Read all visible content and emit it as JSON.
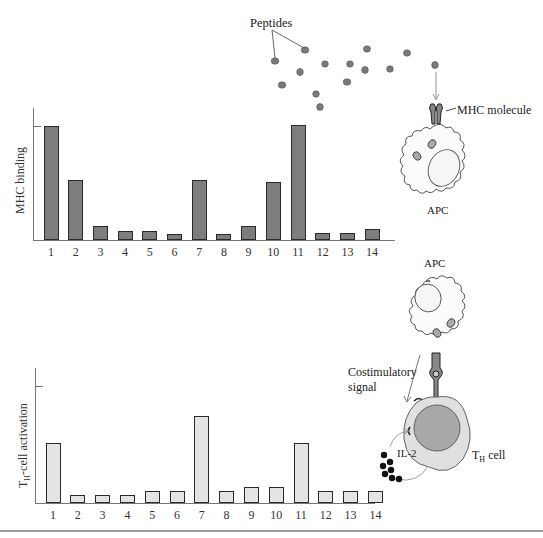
{
  "top_panel": {
    "ylabel": "MHC binding",
    "peptides_label": "Peptides",
    "mhc_label": "MHC molecule",
    "apc_label": "APC"
  },
  "bottom_panel": {
    "ylabel_main": "T",
    "ylabel_sub": "H",
    "ylabel_rest": "-cell activation",
    "apc_label": "APC",
    "costim_label_line1": "Costimulatory",
    "costim_label_line2": "signal",
    "il2_label": "IL-2",
    "th_label_main": "T",
    "th_label_sub": "H",
    "th_label_rest": " cell"
  },
  "chart_data": [
    {
      "type": "bar",
      "title": "",
      "xlabel": "",
      "ylabel": "MHC binding",
      "categories": [
        "1",
        "2",
        "3",
        "4",
        "5",
        "6",
        "7",
        "8",
        "9",
        "10",
        "11",
        "12",
        "13",
        "14"
      ],
      "values": [
        100,
        53,
        12,
        8,
        8,
        5,
        53,
        5,
        12,
        51,
        101,
        6,
        6,
        10
      ],
      "ylim": [
        0,
        100
      ],
      "bar_color": "#7d7d7d",
      "grid": false
    },
    {
      "type": "bar",
      "title": "",
      "xlabel": "",
      "ylabel": "TH-cell activation",
      "categories": [
        "1",
        "2",
        "3",
        "4",
        "5",
        "6",
        "7",
        "8",
        "9",
        "10",
        "11",
        "12",
        "13",
        "14"
      ],
      "values": [
        51,
        7,
        7,
        7,
        10,
        10,
        74,
        10,
        14,
        14,
        51,
        10,
        10,
        10
      ],
      "ylim": [
        0,
        100
      ],
      "bar_color": "#e4e4e4",
      "grid": false
    }
  ]
}
